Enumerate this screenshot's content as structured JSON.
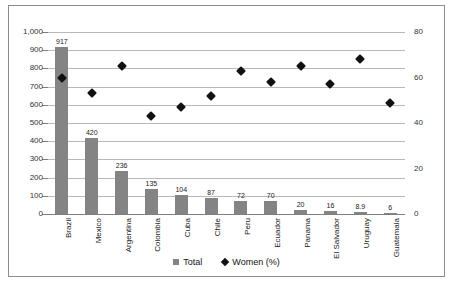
{
  "chart_data": {
    "type": "bar",
    "title": "",
    "subtitle": "",
    "xlabel": "",
    "ylabel": "",
    "categories": [
      "Brazil",
      "Mexico",
      "Argentina",
      "Colombia",
      "Cuba",
      "Chile",
      "Peru",
      "Ecuador",
      "Panama",
      "El Salvador",
      "Uruguay",
      "Guatemala"
    ],
    "series": [
      {
        "name": "Total",
        "type": "bar",
        "axis": "left",
        "values": [
          917,
          420,
          236,
          135,
          104,
          87,
          72,
          70,
          20,
          16,
          8.9,
          6
        ],
        "data_labels": [
          "917",
          "420",
          "236",
          "135",
          "104",
          "87",
          "72",
          "70",
          "20",
          "16",
          "8.9",
          "6"
        ],
        "color": "#848484"
      },
      {
        "name": "Women (%)",
        "type": "scatter",
        "axis": "right",
        "values": [
          60,
          53,
          65,
          43,
          47,
          52,
          63,
          58,
          65,
          57,
          68,
          49
        ],
        "color": "#111111"
      }
    ],
    "left_axis": {
      "ylim": [
        0,
        1000
      ],
      "ticks": [
        0,
        100,
        200,
        300,
        400,
        500,
        600,
        700,
        800,
        900,
        1000
      ],
      "tick_labels": [
        "0",
        "100",
        "200",
        "300",
        "400",
        "500",
        "600",
        "700",
        "800",
        "900",
        "1,000"
      ]
    },
    "right_axis": {
      "ylim": [
        0,
        80
      ],
      "ticks": [
        0,
        20,
        40,
        60,
        80
      ],
      "tick_labels": [
        "0",
        "20",
        "40",
        "60",
        "80"
      ]
    },
    "grid": true,
    "legend_position": "bottom",
    "legend": [
      {
        "label": "Total",
        "marker": "square-marker",
        "color": "#848484"
      },
      {
        "label": "Women (%)",
        "marker": "diamond-marker",
        "color": "#111111"
      }
    ]
  }
}
